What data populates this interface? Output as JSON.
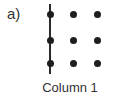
{
  "panel_label": "a)",
  "caption": "Column 1",
  "grid": {
    "rows": 3,
    "columns": 3,
    "dot_color": "#1e1e1e",
    "highlighted_column": 1,
    "line_through_column": true
  }
}
